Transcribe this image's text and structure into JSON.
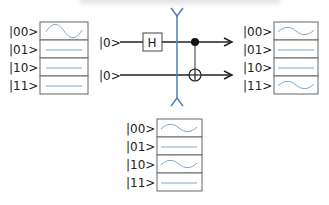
{
  "diagram": {
    "type": "quantum-circuit-bell-state",
    "colors": {
      "wire": "#222222",
      "measurement_line": "#4a7fc1",
      "amplitude_curve": "#7fa6cf",
      "box_border": "#666666"
    },
    "initial_state": {
      "rows": [
        {
          "label": "|00>",
          "amplitude": "wave"
        },
        {
          "label": "|01>",
          "amplitude": "flat"
        },
        {
          "label": "|10>",
          "amplitude": "flat"
        },
        {
          "label": "|11>",
          "amplitude": "flat"
        }
      ]
    },
    "circuit": {
      "qubits": [
        {
          "input_label": "|0>"
        },
        {
          "input_label": "|0>"
        }
      ],
      "gates": [
        {
          "type": "H",
          "label": "H",
          "qubit": 0
        },
        {
          "type": "CNOT",
          "control": 0,
          "target": 1
        }
      ],
      "measurement_slice": "between H and CNOT"
    },
    "final_state": {
      "rows": [
        {
          "label": "|00>",
          "amplitude": "wave"
        },
        {
          "label": "|01>",
          "amplitude": "flat"
        },
        {
          "label": "|10>",
          "amplitude": "flat"
        },
        {
          "label": "|11>",
          "amplitude": "wave"
        }
      ]
    },
    "intermediate_state": {
      "rows": [
        {
          "label": "|00>",
          "amplitude": "wave"
        },
        {
          "label": "|01>",
          "amplitude": "flat"
        },
        {
          "label": "|10>",
          "amplitude": "wave"
        },
        {
          "label": "|11>",
          "amplitude": "flat"
        }
      ]
    }
  }
}
